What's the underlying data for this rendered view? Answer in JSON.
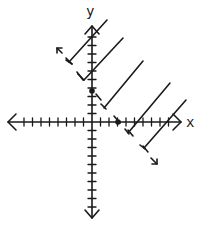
{
  "diagram": {
    "type": "linear-inequality-graph",
    "x_axis_label": "x",
    "y_axis_label": "y",
    "tick_spacing_units": 1,
    "x_range": [
      -10,
      10
    ],
    "y_range": [
      -10,
      10
    ],
    "boundary": {
      "style": "dashed",
      "points_marked": [
        {
          "x": 0,
          "y": 4,
          "label": "y-intercept"
        },
        {
          "x": 3,
          "y": 0,
          "label": "x-intercept"
        }
      ],
      "equation": "4x + 3y = 12",
      "arrow_start": "up-left",
      "arrow_end": "down-right"
    },
    "shaded_region": "above-right of boundary (away from origin)",
    "inequality": "4x + 3y > 12"
  },
  "colors": {
    "ink": "#1a1a1a",
    "background": "#ffffff"
  }
}
